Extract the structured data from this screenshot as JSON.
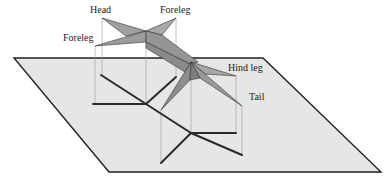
{
  "diagram": {
    "labels": {
      "head": "Head",
      "foreleg_right": "Foreleg",
      "foreleg_left": "Foreleg",
      "hind_leg": "Hind leg",
      "tail": "Tail"
    },
    "colors": {
      "plane_fill": "#e6e6e6",
      "plane_edge": "#222222",
      "body_fill_light": "#a8a8a8",
      "body_fill_dark": "#8c8c8c",
      "shadow_stroke": "#2a2a2a",
      "projection_line": "#9a9a9a",
      "text": "#222222"
    }
  }
}
